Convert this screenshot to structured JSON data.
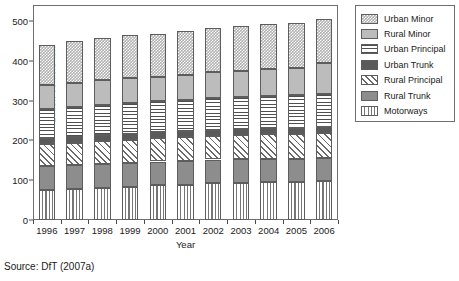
{
  "source_note": "Source: DfT (2007a)",
  "chart_data": {
    "type": "bar",
    "stacked": true,
    "title": "",
    "xlabel": "Year",
    "ylabel": "Billion vehicle-km",
    "categories": [
      "1996",
      "1997",
      "1998",
      "1999",
      "2000",
      "2001",
      "2002",
      "2003",
      "2004",
      "2005",
      "2006"
    ],
    "ylim": [
      0,
      540
    ],
    "yticks": [
      0,
      100,
      200,
      300,
      400,
      500
    ],
    "ytick_labels": [
      "0",
      "100",
      "200",
      "300",
      "400",
      "500"
    ],
    "grid": false,
    "legend_position": "right-outside",
    "series": [
      {
        "name": "Motorways",
        "pattern": "vertical-lines",
        "color": "#ffffff",
        "values": [
          75,
          78,
          81,
          84,
          87,
          89,
          92,
          93,
          95,
          96,
          98
        ]
      },
      {
        "name": "Rural Trunk",
        "pattern": "solid-medium-gray",
        "color": "#8d8d8d",
        "values": [
          60,
          60,
          60,
          60,
          60,
          60,
          60,
          60,
          59,
          58,
          57
        ]
      },
      {
        "name": "Rural Principal",
        "pattern": "diagonal-hatch",
        "color": "#ffffff",
        "values": [
          55,
          56,
          57,
          58,
          58,
          59,
          60,
          61,
          62,
          63,
          64
        ]
      },
      {
        "name": "Urban Trunk",
        "pattern": "solid-dark-gray",
        "color": "#5a5a5a",
        "values": [
          15,
          15,
          15,
          15,
          15,
          15,
          15,
          15,
          15,
          15,
          15
        ]
      },
      {
        "name": "Urban Principal",
        "pattern": "horizontal-lines",
        "color": "#ffffff",
        "values": [
          75,
          76,
          77,
          78,
          78,
          79,
          80,
          80,
          81,
          81,
          82
        ]
      },
      {
        "name": "Rural Minor",
        "pattern": "solid-light-gray",
        "color": "#bcbcbc",
        "values": [
          60,
          60,
          61,
          62,
          62,
          63,
          65,
          66,
          68,
          70,
          79
        ]
      },
      {
        "name": "Urban Minor",
        "pattern": "checkered",
        "color": "#b0b0b0",
        "values": [
          100,
          105,
          107,
          108,
          107,
          110,
          111,
          112,
          113,
          113,
          110
        ]
      }
    ],
    "totals": [
      440,
      450,
      458,
      465,
      467,
      475,
      483,
      487,
      493,
      496,
      505
    ]
  },
  "legend": {
    "items": [
      {
        "label": "Urban Minor",
        "swatch": "p-urban-minor"
      },
      {
        "label": "Rural Minor",
        "swatch": "p-rural-minor"
      },
      {
        "label": "Urban Principal",
        "swatch": "p-urban-principal"
      },
      {
        "label": "Urban Trunk",
        "swatch": "p-urban-trunk"
      },
      {
        "label": "Rural Principal",
        "swatch": "p-rural-principal"
      },
      {
        "label": "Rural Trunk",
        "swatch": "p-rural-trunk"
      },
      {
        "label": "Motorways",
        "swatch": "p-motorways"
      }
    ]
  }
}
